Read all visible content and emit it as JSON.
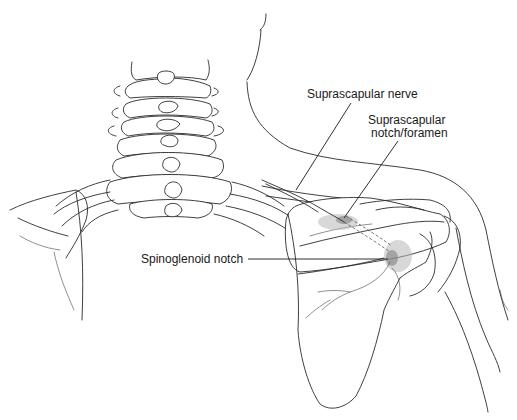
{
  "figure": {
    "labels": {
      "suprascapular_nerve": "Suprascapular nerve",
      "suprascapular_notch_line1": "Suprascapular",
      "suprascapular_notch_line2": "notch/foramen",
      "spinoglenoid_notch": "Spinoglenoid notch"
    }
  }
}
